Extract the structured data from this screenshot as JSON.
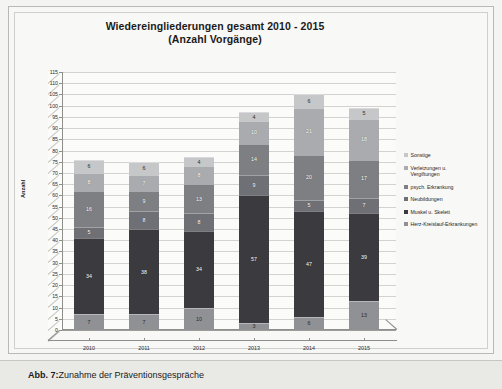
{
  "figure": {
    "caption_label": "Abb. 7:",
    "caption_text": " Zunahme der Präventionsgespräche"
  },
  "chart_data": {
    "type": "bar",
    "stacked": true,
    "three_d": true,
    "title": "Wiedereingliederungen gesamt 2010 - 2015",
    "subtitle": "(Anzahl Vorgänge)",
    "xlabel": "",
    "ylabel": "Anzahl",
    "ylim": [
      0,
      115
    ],
    "ytick_step": 5,
    "grid": true,
    "legend_position": "right",
    "categories": [
      "2010",
      "2011",
      "2012",
      "2013",
      "2014",
      "2015"
    ],
    "yticks": [
      "0",
      "5",
      "10",
      "15",
      "20",
      "25",
      "30",
      "35",
      "40",
      "45",
      "50",
      "55",
      "60",
      "65",
      "70",
      "75",
      "80",
      "85",
      "90",
      "95",
      "100",
      "105",
      "110",
      "115"
    ],
    "series": [
      {
        "name": "Herz-Kreislauf-Erkrankungen",
        "color": "#8f9195",
        "label_light": true,
        "values": [
          7,
          7,
          10,
          3,
          6,
          13
        ]
      },
      {
        "name": "Muskel u. Skelett",
        "color": "#3b3b3f",
        "label_light": false,
        "values": [
          34,
          38,
          34,
          57,
          47,
          39
        ]
      },
      {
        "name": "Neubildungen",
        "color": "#6e7075",
        "label_light": false,
        "values": [
          5,
          8,
          8,
          9,
          5,
          7
        ]
      },
      {
        "name": "psych. Erkrankung",
        "color": "#7d7f83",
        "label_light": false,
        "values": [
          16,
          9,
          13,
          14,
          20,
          17
        ]
      },
      {
        "name": "Verletzungen u.\nVergiftungen",
        "color": "#a9abae",
        "label_light": false,
        "values": [
          8,
          7,
          8,
          10,
          21,
          18
        ]
      },
      {
        "name": "Sonstige",
        "color": "#c6c7c9",
        "label_light": true,
        "values": [
          6,
          6,
          4,
          4,
          6,
          5
        ]
      }
    ],
    "totals": [
      76,
      75,
      77,
      97,
      105,
      99
    ]
  }
}
